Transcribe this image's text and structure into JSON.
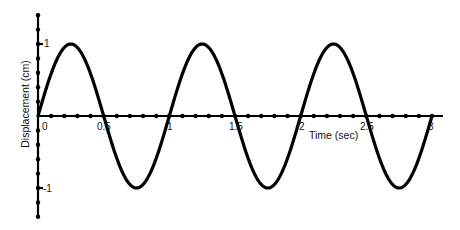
{
  "chart_data": {
    "type": "line",
    "title": "",
    "xlabel": "Time (sec)",
    "ylabel": "Displacement (cm)",
    "xlim": [
      0,
      3
    ],
    "ylim": [
      -1,
      1
    ],
    "x_tick_labels": [
      "0",
      "0.5",
      "1",
      "1.5",
      "2",
      "2.5",
      "3"
    ],
    "y_tick_labels": [
      "1",
      "-1"
    ],
    "grid": false,
    "legend": null,
    "series": [
      {
        "name": "displacement",
        "function": "sin(2*pi*t)",
        "amplitude": 1,
        "period": 1,
        "x": [
          0,
          0.25,
          0.5,
          0.75,
          1,
          1.25,
          1.5,
          1.75,
          2,
          2.25,
          2.5,
          2.75,
          3
        ],
        "values": [
          0,
          1,
          0,
          -1,
          0,
          1,
          0,
          -1,
          0,
          1,
          0,
          -1,
          0
        ],
        "color": "#000000"
      }
    ]
  },
  "labels": {
    "xlabel": "Time (sec)",
    "ylabel": "Displacement (cm)",
    "x0": "0",
    "x05": "0.5",
    "x1": "1",
    "x15": "1.5",
    "x2": "2",
    "x25": "2.5",
    "x3": "3",
    "y1": "1",
    "ym1": "-1"
  }
}
